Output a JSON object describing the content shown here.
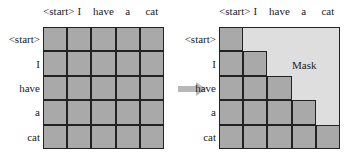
{
  "tokens": [
    "<start>",
    "I",
    "have",
    "a",
    "cat"
  ],
  "left_matrix": {
    "label": "full attention matrix"
  },
  "right_matrix": {
    "label": "masked attention matrix",
    "mask_text": "Mask"
  },
  "colors": {
    "cell": "#a9a9a9",
    "mask": "#dedede",
    "line": "#222222",
    "arrow": "#b8b8b8"
  }
}
